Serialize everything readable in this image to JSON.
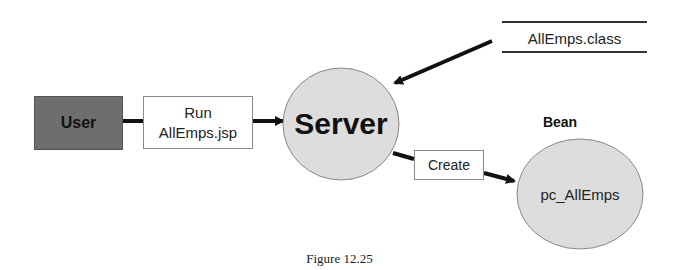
{
  "diagram": {
    "nodes": {
      "user": {
        "label": "User",
        "fill": "#6e6e6e",
        "shape": "rectangle"
      },
      "run_request": {
        "line1": "Run",
        "line2": "AllEmps.jsp",
        "shape": "rectangle"
      },
      "server": {
        "label": "Server",
        "fill": "#dddddd",
        "shape": "ellipse"
      },
      "class_file": {
        "label": "AllEmps.class",
        "shape": "datastore"
      },
      "create_action": {
        "label": "Create",
        "shape": "rectangle"
      },
      "bean": {
        "title": "Bean",
        "label": "pc_AllEmps",
        "fill": "#dddddd",
        "shape": "ellipse"
      }
    },
    "edges": [
      {
        "from": "user",
        "to": "run_request",
        "type": "line"
      },
      {
        "from": "run_request",
        "to": "server",
        "type": "arrow"
      },
      {
        "from": "class_file",
        "to": "server",
        "type": "arrow"
      },
      {
        "from": "server",
        "to": "create_action",
        "type": "line"
      },
      {
        "from": "create_action",
        "to": "bean",
        "type": "arrow"
      }
    ],
    "caption": "Figure 12.25"
  }
}
